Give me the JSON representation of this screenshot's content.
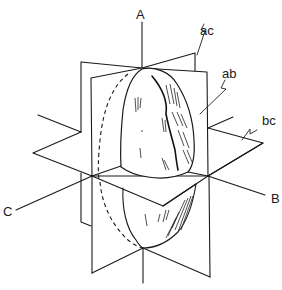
{
  "figure": {
    "type": "3D anatomical reference planes around an ellipsoidal body",
    "axes": [
      {
        "id": "A",
        "label": "A"
      },
      {
        "id": "B",
        "label": "B"
      },
      {
        "id": "C",
        "label": "C"
      }
    ],
    "planes": [
      {
        "id": "ac",
        "label": "ac"
      },
      {
        "id": "ab",
        "label": "ab"
      },
      {
        "id": "bc",
        "label": "bc"
      }
    ],
    "colors": {
      "ink": "#1a1a1a",
      "background": "#ffffff"
    }
  }
}
